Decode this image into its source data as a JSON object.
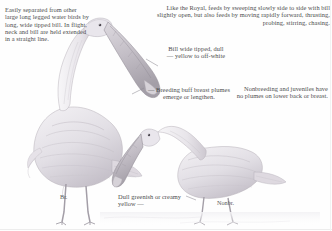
{
  "plate": {
    "subject": "spoonbill-field-guide-plate",
    "background_color": "#fefefe",
    "ink_color": "#4d4d4d"
  },
  "notes": {
    "separation": "Easily separated from other large long legged water birds by long, wide tipped bill. In flight, neck and bill are held extended in a straight line.",
    "feeding": "Like the Royal, feeds by sweeping slowly side to side with bill slightly open, but also feeds by moving rapidly forward, thrusting, probing, stirring, chasing.",
    "bill": "Bill wide tipped, dull\n— yellow to off-white",
    "bill_line1": "Bill wide tipped, dull",
    "bill_line2": "— yellow to off-white",
    "breast": "— Breeding buff breast plumes emerge or lengthen.",
    "nonbreeding": "Nonbreeding and juveniles have no plumes on lower back or breast.",
    "leg_color": "Dull greenish or creamy yellow —"
  },
  "labels": {
    "breeding": "Br.",
    "nonbreeding": "Nonbr."
  },
  "icons": {
    "standing_bird": "standing-spoonbill-illustration",
    "foraging_bird": "foraging-spoonbill-illustration",
    "leader_line": "leader-line"
  },
  "colors": {
    "ink": "#4d4d4d",
    "sketch_light": "#cfcbd2",
    "sketch_mid": "#a9a4ad",
    "sketch_dark": "#8b858f",
    "paper": "#fefefe",
    "bill_fill": "#c9c4cb",
    "leg_fill": "#bdb8c0"
  }
}
